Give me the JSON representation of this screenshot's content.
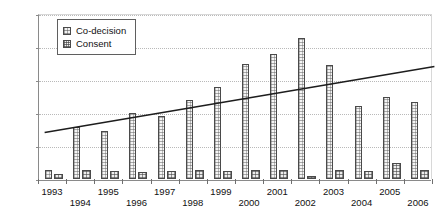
{
  "chart_data": {
    "type": "bar",
    "title": "",
    "xlabel": "",
    "ylabel": "",
    "ylim": [
      0,
      250
    ],
    "yticks": [
      0,
      50,
      100,
      150,
      200,
      250
    ],
    "grid": true,
    "legend_position": "top-left",
    "categories": [
      "1993",
      "1994",
      "1995",
      "1996",
      "1997",
      "1998",
      "1999",
      "2000",
      "2001",
      "2002",
      "2003",
      "2004",
      "2005",
      "2006"
    ],
    "series": [
      {
        "name": "Co-decision",
        "values": [
          14,
          79,
          72,
          100,
          95,
          119,
          139,
          175,
          190,
          213,
          173,
          110,
          124,
          117
        ]
      },
      {
        "name": "Consent",
        "values": [
          8,
          13,
          12,
          10,
          12,
          13,
          12,
          13,
          13,
          5,
          13,
          12,
          25,
          13
        ]
      }
    ],
    "annotations": [
      {
        "name": "trend-line",
        "type": "line",
        "x_start": "1993",
        "x_end": "2006",
        "y_start": 72,
        "y_end": 172
      }
    ]
  },
  "legend": {
    "items": [
      {
        "label": "Co-decision",
        "key": "codecision"
      },
      {
        "label": "Consent",
        "key": "consent"
      }
    ]
  }
}
